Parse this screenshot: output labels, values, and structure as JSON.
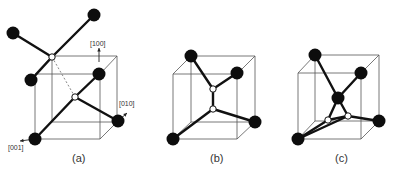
{
  "figure": {
    "panels": [
      {
        "id": "a",
        "caption": "(a)",
        "caption_pos": [
          72,
          162
        ],
        "cube": {
          "back": [
            [
              52,
              56
            ],
            [
              117,
              56
            ],
            [
              117,
              122
            ],
            [
              52,
              122
            ]
          ],
          "front": [
            [
              35,
              74
            ],
            [
              100,
              74
            ],
            [
              100,
              139
            ],
            [
              35,
              139
            ]
          ]
        },
        "atoms": [
          [
            13,
            33
          ],
          [
            94,
            15
          ],
          [
            31,
            80
          ],
          [
            99,
            74
          ],
          [
            118,
            121
          ],
          [
            35,
            139
          ]
        ],
        "vacancies": [
          [
            52,
            57
          ],
          [
            75,
            97
          ]
        ],
        "bonds": [
          [
            [
              13,
              33
            ],
            [
              52,
              57
            ]
          ],
          [
            [
              94,
              15
            ],
            [
              52,
              57
            ]
          ],
          [
            [
              31,
              80
            ],
            [
              52,
              57
            ]
          ],
          [
            [
              99,
              74
            ],
            [
              75,
              97
            ]
          ],
          [
            [
              118,
              121
            ],
            [
              75,
              97
            ]
          ],
          [
            [
              35,
              139
            ],
            [
              75,
              97
            ]
          ]
        ],
        "dashed": [
          [
            [
              52,
              57
            ],
            [
              75,
              97
            ]
          ]
        ],
        "axes": [
          {
            "label": "[100]",
            "from": [
              99,
              62
            ],
            "to": [
              99,
              48
            ],
            "label_pos": [
              90,
              46
            ]
          },
          {
            "label": "[010]",
            "from": [
              118,
              121
            ],
            "to": [
              127,
              113
            ],
            "label_pos": [
              119,
              106
            ]
          },
          {
            "label": "[001]",
            "from": [
              35,
              139
            ],
            "to": [
              20,
              141
            ],
            "label_pos": [
              8,
              150
            ]
          }
        ]
      },
      {
        "id": "b",
        "caption": "(b)",
        "caption_pos": [
          210,
          162
        ],
        "cube": {
          "back": [
            [
              191,
              56
            ],
            [
              255,
              56
            ],
            [
              255,
              122
            ],
            [
              191,
              122
            ]
          ],
          "front": [
            [
              173,
              74
            ],
            [
              237,
              74
            ],
            [
              237,
              139
            ],
            [
              173,
              139
            ]
          ]
        },
        "atoms": [
          [
            191,
            56
          ],
          [
            237,
            73
          ],
          [
            255,
            122
          ],
          [
            173,
            139
          ]
        ],
        "vacancies": [
          [
            213,
            89
          ],
          [
            213,
            109
          ]
        ],
        "bonds": [
          [
            [
              191,
              56
            ],
            [
              213,
              89
            ]
          ],
          [
            [
              237,
              73
            ],
            [
              213,
              89
            ]
          ],
          [
            [
              213,
              89
            ],
            [
              213,
              109
            ]
          ],
          [
            [
              255,
              122
            ],
            [
              213,
              109
            ]
          ],
          [
            [
              173,
              139
            ],
            [
              213,
              109
            ]
          ]
        ],
        "dashed": [],
        "axes": []
      },
      {
        "id": "c",
        "caption": "(c)",
        "caption_pos": [
          335,
          162
        ],
        "cube": {
          "back": [
            [
              315,
              55
            ],
            [
              379,
              55
            ],
            [
              379,
              121
            ],
            [
              315,
              121
            ]
          ],
          "front": [
            [
              298,
              73
            ],
            [
              361,
              73
            ],
            [
              361,
              139
            ],
            [
              298,
              139
            ]
          ]
        },
        "atoms": [
          [
            315,
            55
          ],
          [
            361,
            73
          ],
          [
            338,
            98
          ],
          [
            379,
            121
          ],
          [
            298,
            139
          ]
        ],
        "vacancies": [
          [
            328,
            120
          ],
          [
            348,
            116
          ]
        ],
        "bonds": [
          [
            [
              315,
              55
            ],
            [
              338,
              98
            ]
          ],
          [
            [
              361,
              73
            ],
            [
              338,
              98
            ]
          ],
          [
            [
              338,
              98
            ],
            [
              328,
              120
            ]
          ],
          [
            [
              338,
              98
            ],
            [
              348,
              116
            ]
          ],
          [
            [
              328,
              120
            ],
            [
              348,
              116
            ]
          ],
          [
            [
              348,
              116
            ],
            [
              379,
              121
            ]
          ],
          [
            [
              328,
              120
            ],
            [
              298,
              139
            ]
          ],
          [
            [
              348,
              116
            ],
            [
              298,
              139
            ]
          ]
        ],
        "dashed": [],
        "axes": []
      }
    ],
    "atom_radius": 6.5,
    "vacancy_radius": 3.2
  }
}
